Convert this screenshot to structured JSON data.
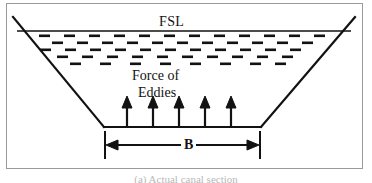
{
  "figure": {
    "caption": "(a) Actual canal section",
    "labels": {
      "fsl": "FSL",
      "force_line1": "Force of",
      "force_line2": "Eddies",
      "bed_width": "B"
    },
    "colors": {
      "ink": "#121212",
      "frame": "#9a9a9a",
      "background": "#ffffff",
      "caption": "#b9b9b9"
    },
    "geometry": {
      "water_surface_y": 27,
      "bed_y": 123,
      "bed_left_x": 97,
      "bed_right_x": 254,
      "top_left_x": 6,
      "top_right_x": 351,
      "eddy_rows": 5,
      "upward_arrow_count": 5
    }
  }
}
